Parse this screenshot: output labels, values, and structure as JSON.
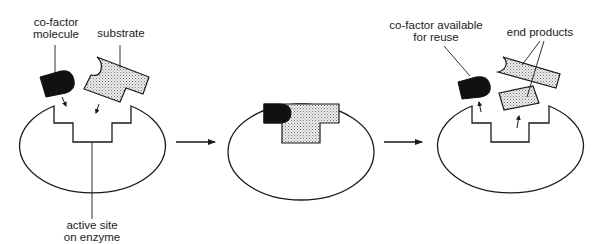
{
  "diagram": {
    "type": "enzyme-cofactor-reaction",
    "stages": [
      {
        "name": "before-binding",
        "labels": {
          "cofactor": [
            "co-factor",
            "molecule"
          ],
          "substrate": "substrate",
          "active_site": [
            "active site",
            "on enzyme"
          ]
        }
      },
      {
        "name": "enzyme-substrate-complex"
      },
      {
        "name": "after-reaction",
        "labels": {
          "cofactor": [
            "co-factor available",
            "for reuse"
          ],
          "products": "end products"
        }
      }
    ],
    "colors": {
      "line": "#1a1a1a",
      "cofactor_fill": "#111111",
      "substrate_fill": "#e4e4e4",
      "background": "#ffffff"
    }
  }
}
